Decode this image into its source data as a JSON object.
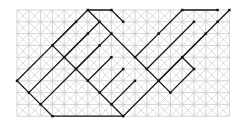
{
  "diagram": {
    "type": "triangulated-grid",
    "grid": {
      "cols": 18,
      "rows": 9,
      "origin_x": 17,
      "origin_y": 10,
      "cell": 11.8
    },
    "colors": {
      "background": "#ffffff",
      "light_line": "#c8c8c8",
      "dark_line": "#1a1a1a",
      "node": "#111111"
    },
    "dark_paths": [
      [
        [
          0,
          6
        ],
        [
          3,
          3
        ],
        [
          6,
          0
        ],
        [
          8,
          0
        ],
        [
          9,
          1
        ]
      ],
      [
        [
          1,
          7
        ],
        [
          4,
          4
        ],
        [
          7,
          1
        ]
      ],
      [
        [
          2,
          8
        ],
        [
          5,
          5
        ],
        [
          8,
          2
        ]
      ],
      [
        [
          0,
          6
        ],
        [
          1,
          7
        ],
        [
          2,
          8
        ],
        [
          3,
          9
        ],
        [
          9,
          9
        ]
      ],
      [
        [
          3,
          3
        ],
        [
          6,
          6
        ],
        [
          9,
          9
        ]
      ],
      [
        [
          6,
          0
        ],
        [
          7,
          1
        ],
        [
          8,
          2
        ],
        [
          10,
          4
        ]
      ],
      [
        [
          9,
          9
        ],
        [
          12,
          6
        ],
        [
          14,
          4
        ],
        [
          17,
          1
        ],
        [
          18,
          0
        ]
      ],
      [
        [
          10,
          4
        ],
        [
          12,
          2
        ],
        [
          14,
          0
        ],
        [
          17,
          0
        ]
      ],
      [
        [
          10,
          4
        ],
        [
          13,
          7
        ]
      ],
      [
        [
          11,
          5
        ],
        [
          15,
          1
        ]
      ],
      [
        [
          12,
          6
        ],
        [
          16,
          2
        ]
      ],
      [
        [
          13,
          7
        ],
        [
          15,
          5
        ]
      ],
      [
        [
          14,
          4
        ],
        [
          15,
          5
        ]
      ],
      [
        [
          3,
          3
        ],
        [
          5,
          1
        ]
      ],
      [
        [
          4,
          4
        ],
        [
          6,
          2
        ]
      ],
      [
        [
          5,
          5
        ],
        [
          7,
          3
        ]
      ],
      [
        [
          6,
          6
        ],
        [
          8,
          4
        ]
      ],
      [
        [
          7,
          7
        ],
        [
          9,
          5
        ]
      ],
      [
        [
          8,
          8
        ],
        [
          10,
          6
        ]
      ]
    ]
  }
}
